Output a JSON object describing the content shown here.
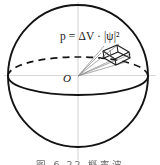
{
  "figure": {
    "type": "physics-diagram",
    "formula": {
      "full_text": "p = ΔV · |ψ|²",
      "lhs": "p",
      "equals": "=",
      "delta_v": "ΔV",
      "dot": "·",
      "psi_abs": "|ψ|",
      "exponent": "2"
    },
    "origin_label": "O",
    "caption": "图 6.22  概率波",
    "colors": {
      "outline": "#111111",
      "faint_axis": "#cfcfcf",
      "cone_ray": "#8d8d8d",
      "box_edge": "#1a1a1a",
      "background": "#ffffff"
    },
    "elements": {
      "sphere_label": "sphere-outline",
      "equator_hidden_label": "equator-dashed-back",
      "equator_visible_label": "equator-solid-front",
      "volume_element_label": "volume-element-box",
      "cone_label": "solid-angle-cone-rays",
      "vertical_axis_label": "vertical-axis",
      "horizontal_axis_label": "horizontal-axis"
    }
  }
}
